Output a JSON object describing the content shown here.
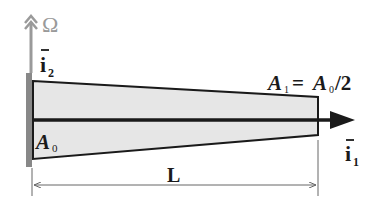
{
  "figure": {
    "type": "tapered-beam-diagram",
    "colors": {
      "background": "#ffffff",
      "beam_fill": "#e6e6e6",
      "outline": "#1a1a1a",
      "wall": "#888888",
      "rotation_arrow": "#9a9a9a",
      "dimension": "#666666"
    }
  },
  "labels": {
    "omega": "Ω",
    "i2_base": "i",
    "i2_sub": "2",
    "i1_base": "i",
    "i1_sub": "1",
    "a0_base": "A",
    "a0_sub": "0",
    "a1_base": "A",
    "a1_sub": "1",
    "a1_eq": "= ",
    "a1_rhs_base": "A",
    "a1_rhs_sub": "0",
    "a1_rhs_tail": "/2",
    "length": "L"
  }
}
